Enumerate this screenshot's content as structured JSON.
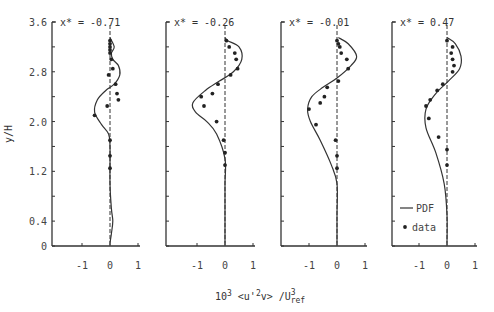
{
  "chart_data": {
    "type": "line",
    "ylabel": "y/H",
    "xlabel": "10^3 <u'^2v> / U^3_ref",
    "xlabel_parts": {
      "base": "10",
      "exp": "3",
      "mid": " <u'",
      "exp2": "2",
      "end": "v> /U",
      "sub": "ref",
      "sup": "3"
    },
    "ylim": [
      0,
      3.6
    ],
    "yticks": [
      "0",
      "0.4",
      "1.2",
      "2.0",
      "2.8",
      "3.6"
    ],
    "xticks": [
      "-1",
      "0",
      "1"
    ],
    "legend": {
      "line": "PDF",
      "marker": "data",
      "position": "inside last panel, lower left"
    },
    "panels": [
      {
        "title": "x* = -0.71",
        "pdf": [
          [
            0.0,
            0.05
          ],
          [
            0.05,
            0.2
          ],
          [
            0.1,
            0.4
          ],
          [
            0.05,
            0.6
          ],
          [
            0.0,
            1.0
          ],
          [
            0.0,
            1.6
          ],
          [
            -0.05,
            1.8
          ],
          [
            -0.3,
            1.95
          ],
          [
            -0.55,
            2.15
          ],
          [
            -0.45,
            2.35
          ],
          [
            -0.15,
            2.5
          ],
          [
            0.15,
            2.6
          ],
          [
            0.35,
            2.75
          ],
          [
            0.3,
            2.9
          ],
          [
            0.1,
            3.0
          ],
          [
            0.05,
            3.1
          ],
          [
            0.15,
            3.2
          ],
          [
            0.0,
            3.35
          ]
        ],
        "data": [
          [
            0.0,
            3.3
          ],
          [
            0.0,
            3.25
          ],
          [
            0.0,
            3.2
          ],
          [
            0.0,
            3.15
          ],
          [
            0.0,
            3.1
          ],
          [
            0.05,
            3.0
          ],
          [
            0.1,
            2.85
          ],
          [
            -0.05,
            2.75
          ],
          [
            0.2,
            2.6
          ],
          [
            0.25,
            2.45
          ],
          [
            0.3,
            2.35
          ],
          [
            -0.1,
            2.25
          ],
          [
            -0.55,
            2.1
          ],
          [
            0.0,
            1.7
          ],
          [
            0.0,
            1.45
          ],
          [
            0.0,
            1.25
          ]
        ]
      },
      {
        "title": "x* = -0.26",
        "pdf": [
          [
            0.0,
            0.05
          ],
          [
            0.0,
            0.5
          ],
          [
            0.0,
            1.0
          ],
          [
            0.0,
            1.4
          ],
          [
            -0.3,
            1.8
          ],
          [
            -0.65,
            2.0
          ],
          [
            -1.05,
            2.15
          ],
          [
            -1.15,
            2.3
          ],
          [
            -0.7,
            2.5
          ],
          [
            -0.2,
            2.65
          ],
          [
            0.3,
            2.8
          ],
          [
            0.6,
            3.0
          ],
          [
            0.5,
            3.2
          ],
          [
            0.1,
            3.3
          ],
          [
            0.0,
            3.35
          ]
        ],
        "data": [
          [
            0.05,
            3.3
          ],
          [
            0.15,
            3.2
          ],
          [
            0.35,
            3.1
          ],
          [
            0.4,
            3.0
          ],
          [
            0.45,
            2.85
          ],
          [
            0.2,
            2.75
          ],
          [
            -0.25,
            2.6
          ],
          [
            -0.45,
            2.45
          ],
          [
            -0.85,
            2.4
          ],
          [
            -0.75,
            2.25
          ],
          [
            -0.3,
            2.0
          ],
          [
            -0.05,
            1.7
          ],
          [
            0.0,
            1.5
          ],
          [
            0.0,
            1.3
          ]
        ]
      },
      {
        "title": "x* = -0.01",
        "pdf": [
          [
            0.0,
            0.05
          ],
          [
            0.0,
            0.5
          ],
          [
            0.0,
            1.0
          ],
          [
            -0.2,
            1.3
          ],
          [
            -0.6,
            1.7
          ],
          [
            -0.95,
            2.0
          ],
          [
            -1.05,
            2.2
          ],
          [
            -0.9,
            2.4
          ],
          [
            -0.5,
            2.55
          ],
          [
            0.0,
            2.7
          ],
          [
            0.5,
            2.9
          ],
          [
            0.7,
            3.05
          ],
          [
            0.4,
            3.25
          ],
          [
            0.05,
            3.35
          ]
        ],
        "data": [
          [
            0.0,
            3.3
          ],
          [
            0.05,
            3.25
          ],
          [
            0.1,
            3.2
          ],
          [
            0.15,
            3.1
          ],
          [
            0.35,
            3.0
          ],
          [
            0.4,
            2.85
          ],
          [
            0.05,
            2.65
          ],
          [
            -0.35,
            2.55
          ],
          [
            -0.45,
            2.4
          ],
          [
            -0.6,
            2.3
          ],
          [
            -1.0,
            2.2
          ],
          [
            -0.75,
            1.95
          ],
          [
            -0.05,
            1.7
          ],
          [
            0.0,
            1.45
          ],
          [
            0.0,
            1.25
          ]
        ]
      },
      {
        "title": "x* = 0.47",
        "pdf": [
          [
            0.0,
            0.05
          ],
          [
            0.0,
            0.5
          ],
          [
            -0.1,
            1.0
          ],
          [
            -0.4,
            1.5
          ],
          [
            -0.75,
            1.9
          ],
          [
            -0.75,
            2.2
          ],
          [
            -0.4,
            2.45
          ],
          [
            0.05,
            2.65
          ],
          [
            0.45,
            2.85
          ],
          [
            0.5,
            3.05
          ],
          [
            0.3,
            3.25
          ],
          [
            0.0,
            3.35
          ]
        ],
        "data": [
          [
            0.0,
            3.3
          ],
          [
            0.2,
            3.2
          ],
          [
            0.15,
            3.1
          ],
          [
            0.2,
            3.0
          ],
          [
            0.25,
            2.9
          ],
          [
            0.2,
            2.8
          ],
          [
            -0.15,
            2.6
          ],
          [
            -0.35,
            2.5
          ],
          [
            -0.6,
            2.35
          ],
          [
            -0.75,
            2.25
          ],
          [
            -0.65,
            2.05
          ],
          [
            -0.3,
            1.75
          ],
          [
            0.0,
            1.55
          ],
          [
            0.0,
            1.3
          ]
        ]
      }
    ]
  }
}
